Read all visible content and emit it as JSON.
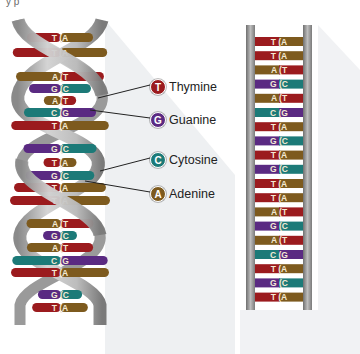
{
  "top_fragment": "y   p",
  "colors": {
    "thymine": "#9b1b1e",
    "guanine": "#5a2a82",
    "cytosine": "#1c7a78",
    "adenine": "#7d5a1e",
    "backbone": "#b9b9b9",
    "backbone_dark": "#7e7e7e",
    "shadow": "#eceef0"
  },
  "legend": [
    {
      "letter": "T",
      "label": "Thymine",
      "color": "#9b1b1e"
    },
    {
      "letter": "G",
      "label": "Guanine",
      "color": "#5a2a82"
    },
    {
      "letter": "C",
      "label": "Cytosine",
      "color": "#1c7a78"
    },
    {
      "letter": "A",
      "label": "Adenine",
      "color": "#7d5a1e"
    }
  ],
  "helix": {
    "rungs": [
      {
        "left": "T",
        "right": "A"
      },
      {
        "left": "T",
        "right": "A"
      },
      {
        "left": "A",
        "right": "T"
      },
      {
        "left": "G",
        "right": "C"
      },
      {
        "left": "A",
        "right": "T"
      },
      {
        "left": "C",
        "right": "G"
      },
      {
        "left": "T",
        "right": "A"
      },
      {
        "left": "G",
        "right": "C"
      },
      {
        "left": "T",
        "right": "A"
      },
      {
        "left": "G",
        "right": "C"
      },
      {
        "left": "T",
        "right": "A"
      },
      {
        "left": "T",
        "right": "A"
      },
      {
        "left": "A",
        "right": "T"
      },
      {
        "left": "G",
        "right": "C"
      },
      {
        "left": "A",
        "right": "T"
      },
      {
        "left": "C",
        "right": "G"
      },
      {
        "left": "T",
        "right": "A"
      },
      {
        "left": "G",
        "right": "C"
      },
      {
        "left": "T",
        "right": "A"
      }
    ]
  },
  "ladder": {
    "rungs": [
      {
        "left": "T",
        "right": "A"
      },
      {
        "left": "T",
        "right": "A"
      },
      {
        "left": "A",
        "right": "T"
      },
      {
        "left": "G",
        "right": "C"
      },
      {
        "left": "A",
        "right": "T"
      },
      {
        "left": "C",
        "right": "G"
      },
      {
        "left": "T",
        "right": "A"
      },
      {
        "left": "G",
        "right": "C"
      },
      {
        "left": "T",
        "right": "A"
      },
      {
        "left": "G",
        "right": "C"
      },
      {
        "left": "T",
        "right": "A"
      },
      {
        "left": "T",
        "right": "A"
      },
      {
        "left": "A",
        "right": "T"
      },
      {
        "left": "G",
        "right": "C"
      },
      {
        "left": "A",
        "right": "T"
      },
      {
        "left": "C",
        "right": "G"
      },
      {
        "left": "T",
        "right": "A"
      },
      {
        "left": "G",
        "right": "C"
      },
      {
        "left": "T",
        "right": "A"
      }
    ]
  }
}
